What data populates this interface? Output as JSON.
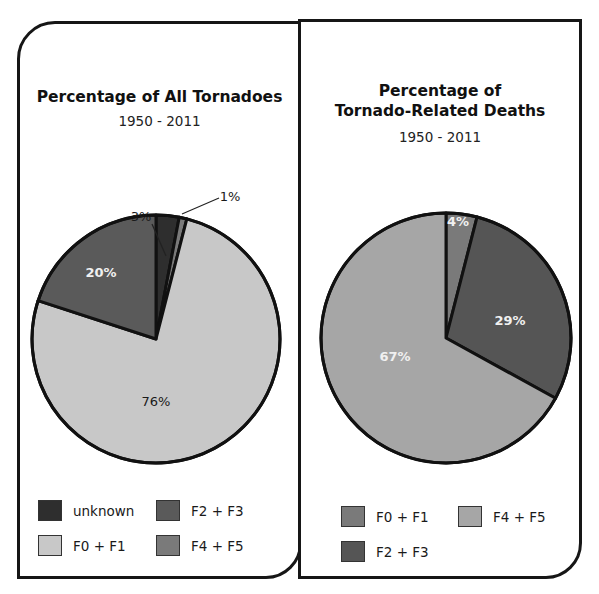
{
  "chart_data": [
    {
      "type": "pie",
      "title": "Percentage of All Tornadoes",
      "subtitle": "1950 - 2011",
      "slices": [
        {
          "label": "unknown",
          "value": 3,
          "data_label": "3%",
          "color": "#2e2e2e",
          "label_style": "outside-leader"
        },
        {
          "label": "F4 + F5",
          "value": 1,
          "data_label": "1%",
          "color": "#7a7a7a",
          "label_style": "outside-leader"
        },
        {
          "label": "F0 + F1",
          "value": 76,
          "data_label": "76%",
          "color": "#c8c8c8",
          "label_style": "inside-dark"
        },
        {
          "label": "F2 + F3",
          "value": 20,
          "data_label": "20%",
          "color": "#5a5a5a",
          "label_style": "inside-light"
        }
      ],
      "legend": [
        {
          "label": "unknown",
          "color": "#2e2e2e"
        },
        {
          "label": "F2 + F3",
          "color": "#5a5a5a"
        },
        {
          "label": "F0 + F1",
          "color": "#c8c8c8"
        },
        {
          "label": "F4 + F5",
          "color": "#7a7a7a"
        }
      ],
      "legend_position": "bottom"
    },
    {
      "type": "pie",
      "title_line1": "Percentage of",
      "title_line2": "Tornado-Related Deaths",
      "subtitle": "1950 - 2011",
      "slices": [
        {
          "label": "F0 + F1",
          "value": 4,
          "data_label": "4%",
          "color": "#7a7a7a",
          "label_style": "inside-light"
        },
        {
          "label": "F2 + F3",
          "value": 29,
          "data_label": "29%",
          "color": "#555555",
          "label_style": "inside-light"
        },
        {
          "label": "F4 + F5",
          "value": 67,
          "data_label": "67%",
          "color": "#a6a6a6",
          "label_style": "inside-light"
        }
      ],
      "legend": [
        {
          "label": "F0 + F1",
          "color": "#7a7a7a"
        },
        {
          "label": "F4 + F5",
          "color": "#a6a6a6"
        },
        {
          "label": "F2 + F3",
          "color": "#555555"
        }
      ],
      "legend_position": "bottom"
    }
  ]
}
